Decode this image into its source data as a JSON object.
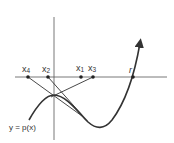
{
  "diagram": {
    "curve_label": "y = p(x)",
    "points": [
      {
        "label": "x",
        "sub": "4",
        "x": 28
      },
      {
        "label": "x",
        "sub": "2",
        "x": 48
      },
      {
        "label": "x",
        "sub": "1",
        "x": 81
      },
      {
        "label": "x",
        "sub": "3",
        "x": 93
      }
    ],
    "root_label": "r",
    "colors": {
      "ink": "#333333",
      "background": "#ffffff"
    }
  }
}
